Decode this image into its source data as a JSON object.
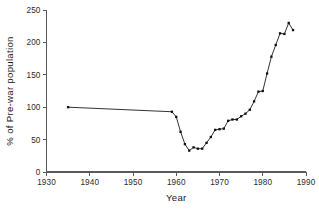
{
  "chart_data": {
    "type": "line",
    "title": "",
    "xlabel": "Year",
    "ylabel": "% of Pre-war population",
    "xlim": [
      1930,
      1990
    ],
    "ylim": [
      0,
      250
    ],
    "xticks": [
      1930,
      1940,
      1950,
      1960,
      1970,
      1980,
      1990
    ],
    "yticks": [
      0,
      50,
      100,
      150,
      200,
      250
    ],
    "grid": false,
    "legend": false,
    "marker": "square",
    "series": [
      {
        "name": "Population index",
        "x": [
          1935,
          1959,
          1960,
          1961,
          1962,
          1963,
          1964,
          1965,
          1966,
          1967,
          1968,
          1969,
          1970,
          1971,
          1972,
          1973,
          1974,
          1975,
          1976,
          1977,
          1978,
          1979,
          1980,
          1981,
          1982,
          1983,
          1984,
          1985,
          1986,
          1987
        ],
        "values": [
          100,
          93,
          85,
          62,
          43,
          33,
          38,
          36,
          36,
          45,
          54,
          65,
          66,
          67,
          79,
          81,
          81,
          86,
          90,
          96,
          109,
          124,
          125,
          152,
          178,
          196,
          214,
          213,
          230,
          219
        ]
      }
    ]
  },
  "axis": {
    "x_tick_labels": [
      "1930",
      "1940",
      "1950",
      "1960",
      "1970",
      "1980",
      "1990"
    ],
    "y_tick_labels": [
      "0",
      "50",
      "100",
      "150",
      "200",
      "250"
    ],
    "x_title": "Year",
    "y_title": "% of Pre-war population"
  }
}
